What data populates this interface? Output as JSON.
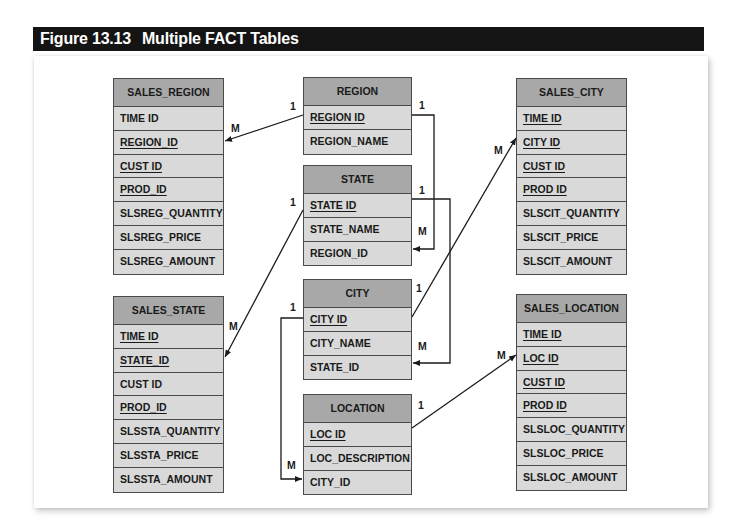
{
  "figure": {
    "number": "Figure 13.13",
    "title": "Multiple FACT Tables"
  },
  "entities": {
    "sales_region": {
      "name": "SALES_REGION",
      "fields": [
        {
          "label": "TIME ID",
          "pk": false
        },
        {
          "label": "REGION_ID",
          "pk": true
        },
        {
          "label": "CUST ID",
          "pk": true
        },
        {
          "label": "PROD_ID",
          "pk": true
        },
        {
          "label": "SLSREG_QUANTITY",
          "pk": false
        },
        {
          "label": "SLSREG_PRICE",
          "pk": false
        },
        {
          "label": "SLSREG_AMOUNT",
          "pk": false
        }
      ]
    },
    "region": {
      "name": "REGION",
      "fields": [
        {
          "label": "REGION ID",
          "pk": true
        },
        {
          "label": "REGION_NAME",
          "pk": false
        }
      ]
    },
    "state": {
      "name": "STATE",
      "fields": [
        {
          "label": "STATE ID",
          "pk": true
        },
        {
          "label": "STATE_NAME",
          "pk": false
        },
        {
          "label": "REGION_ID",
          "pk": false
        }
      ]
    },
    "city": {
      "name": "CITY",
      "fields": [
        {
          "label": "CITY ID",
          "pk": true
        },
        {
          "label": "CITY_NAME",
          "pk": false
        },
        {
          "label": "STATE_ID",
          "pk": false
        }
      ]
    },
    "location": {
      "name": "LOCATION",
      "fields": [
        {
          "label": "LOC ID",
          "pk": true
        },
        {
          "label": "LOC_DESCRIPTION",
          "pk": false
        },
        {
          "label": "CITY_ID",
          "pk": false
        }
      ]
    },
    "sales_city": {
      "name": "SALES_CITY",
      "fields": [
        {
          "label": "TIME ID",
          "pk": true
        },
        {
          "label": "CITY ID",
          "pk": true
        },
        {
          "label": "CUST ID",
          "pk": true
        },
        {
          "label": "PROD ID",
          "pk": true
        },
        {
          "label": "SLSCIT_QUANTITY",
          "pk": false
        },
        {
          "label": "SLSCIT_PRICE",
          "pk": false
        },
        {
          "label": "SLSCIT_AMOUNT",
          "pk": false
        }
      ]
    },
    "sales_state": {
      "name": "SALES_STATE",
      "fields": [
        {
          "label": "TIME ID",
          "pk": true
        },
        {
          "label": "STATE_ID",
          "pk": true
        },
        {
          "label": "CUST ID",
          "pk": false
        },
        {
          "label": "PROD_ID",
          "pk": true
        },
        {
          "label": "SLSSTA_QUANTITY",
          "pk": false
        },
        {
          "label": "SLSSTA_PRICE",
          "pk": false
        },
        {
          "label": "SLSSTA_AMOUNT",
          "pk": false
        }
      ]
    },
    "sales_location": {
      "name": "SALES_LOCATION",
      "fields": [
        {
          "label": "TIME ID",
          "pk": true
        },
        {
          "label": "LOC ID",
          "pk": true
        },
        {
          "label": "CUST ID",
          "pk": true
        },
        {
          "label": "PROD ID",
          "pk": true
        },
        {
          "label": "SLSLOC_QUANTITY",
          "pk": false
        },
        {
          "label": "SLSLOC_PRICE",
          "pk": false
        },
        {
          "label": "SLSLOC_AMOUNT",
          "pk": false
        }
      ]
    }
  },
  "relationships": [
    {
      "from": "REGION.REGION ID",
      "to": "SALES_REGION.REGION_ID",
      "from_card": "1",
      "to_card": "M"
    },
    {
      "from": "REGION.REGION ID",
      "to": "STATE.REGION_ID",
      "from_card": "1",
      "to_card": "M"
    },
    {
      "from": "STATE.STATE ID",
      "to": "SALES_STATE.STATE_ID",
      "from_card": "1",
      "to_card": "M"
    },
    {
      "from": "STATE.STATE ID",
      "to": "CITY.STATE_ID",
      "from_card": "1",
      "to_card": "M"
    },
    {
      "from": "CITY.CITY ID",
      "to": "SALES_CITY.CITY ID",
      "from_card": "1",
      "to_card": "M"
    },
    {
      "from": "CITY.CITY ID",
      "to": "LOCATION.CITY_ID",
      "from_card": "1",
      "to_card": "M"
    },
    {
      "from": "LOCATION.LOC ID",
      "to": "SALES_LOCATION.LOC ID",
      "from_card": "1",
      "to_card": "M"
    }
  ],
  "cardinality_labels": {
    "one": "1",
    "many": "M"
  },
  "colors": {
    "title_bar": "#141414",
    "header_fill": "#a8a8a8",
    "row_fill": "#d9d9d9",
    "border": "#4a4a4a"
  }
}
